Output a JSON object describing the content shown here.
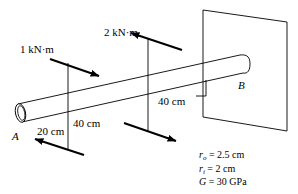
{
  "figure": {
    "kind": "engineering-diagram",
    "background_color": "#ffffff",
    "line_color": "#000000",
    "width": 298,
    "height": 194
  },
  "labels": {
    "torque_1": "1 kN·m",
    "torque_2": "2 kN·m",
    "dim_left": "20 cm",
    "dim_mid": "40 cm",
    "dim_right": "40 cm",
    "point_a": "A",
    "point_b": "B"
  },
  "properties": {
    "r_outer_symbol": "r",
    "r_outer_sub": "o",
    "r_outer_value": "= 2.5 cm",
    "r_inner_symbol": "r",
    "r_inner_sub": "i",
    "r_inner_value": "= 2 cm",
    "g_symbol": "G",
    "g_value": "= 30 GPa"
  },
  "geometry": {
    "torques": [
      {
        "name": "torque-1",
        "magnitude": 1,
        "unit": "kN·m",
        "station_cm": 20,
        "top_arrow_direction": "down-right",
        "bottom_arrow_direction": "up-left"
      },
      {
        "name": "torque-2",
        "magnitude": 2,
        "unit": "kN·m",
        "station_cm": 60,
        "top_arrow_direction": "up-left",
        "bottom_arrow_direction": "down-right"
      }
    ],
    "segments": [
      {
        "from": "A",
        "to": "torque-1",
        "length_cm": 20
      },
      {
        "from": "torque-1",
        "to": "torque-2",
        "length_cm": 40
      },
      {
        "from": "torque-2",
        "to": "B",
        "length_cm": 40
      }
    ]
  }
}
